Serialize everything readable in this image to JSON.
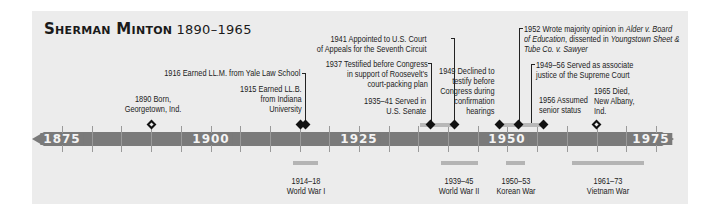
{
  "title": {
    "name": "Sherman Minton",
    "years": "1890–1965"
  },
  "axis": {
    "labels": [
      {
        "year": 1875,
        "label": "1875"
      },
      {
        "year": 1900,
        "label": "1900"
      },
      {
        "year": 1925,
        "label": "1925"
      },
      {
        "year": 1950,
        "label": "1950"
      },
      {
        "year": 1975,
        "label": "1975"
      }
    ],
    "tick_interval_years": 5,
    "range": [
      1875,
      1975
    ]
  },
  "events": {
    "born": {
      "lines": [
        "1890 Born,",
        "Georgetown, Ind."
      ]
    },
    "llm": {
      "text": "1916 Earned LL.M. from Yale Law School"
    },
    "llb": {
      "lines": [
        "1915 Earned LL.B.",
        "from Indiana",
        "University"
      ]
    },
    "court_packing": {
      "lines": [
        "1937 Testified before Congress",
        "in support of Roosevelt’s",
        "court-packing plan"
      ]
    },
    "appeals": {
      "lines": [
        "1941 Appointed to U.S. Court",
        "of Appeals for the Seventh Circuit"
      ]
    },
    "senate": {
      "lines": [
        "1935–41 Served in",
        "U.S. Senate"
      ]
    },
    "declined": {
      "lines": [
        "1949 Declined to",
        "testify before",
        "Congress during",
        "confirmation",
        "hearings"
      ]
    },
    "majority_opinion": {
      "line1_prefix": "1952 Wrote majority opinion in ",
      "line1_italic": "Alder v. Board",
      "line2_italic": "of Education",
      "line2_mid": ", dissented in ",
      "line2_italic2": "Youngstown Sheet &",
      "line3_italic": "Tube Co. v. Sawyer"
    },
    "associate_justice": {
      "lines": [
        "1949–56 Served as associate",
        "justice of the Supreme Court"
      ]
    },
    "senior_status": {
      "lines": [
        "1956 Assumed",
        "senior status"
      ]
    },
    "died": {
      "lines": [
        "1965 Died,",
        "New Albany,",
        "Ind."
      ]
    }
  },
  "context_periods": [
    {
      "years": "1914–18",
      "name": "World War I"
    },
    {
      "years": "1939–45",
      "name": "World War II"
    },
    {
      "years": "1950–53",
      "name": "Korean War"
    },
    {
      "years": "1961–73",
      "name": "Vietnam War"
    }
  ],
  "colors": {
    "background": "#ececec",
    "axis": "#7a7a7a",
    "range_bar": "#b4b4b4",
    "marker": "#111111"
  }
}
